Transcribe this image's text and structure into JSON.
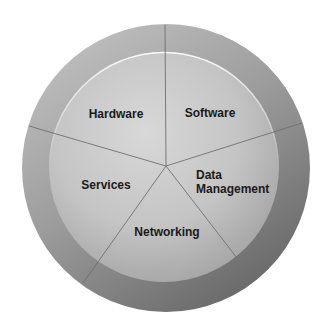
{
  "diagram": {
    "type": "segmented-circle",
    "segments": [
      {
        "id": "hardware",
        "label": "Hardware"
      },
      {
        "id": "software",
        "label": "Software"
      },
      {
        "id": "data-management",
        "label_line1": "Data",
        "label_line2": "Management"
      },
      {
        "id": "networking",
        "label": "Networking"
      },
      {
        "id": "services",
        "label": "Services"
      }
    ],
    "colors": {
      "background": "#ffffff",
      "outer_ring_light": "#b4b4b4",
      "outer_ring_dark": "#6e6e6e",
      "inner_fill_light": "#d6d6d6",
      "inner_fill_dark": "#a4a4a4",
      "divider": "#6f6f6f",
      "text": "#1a1a1a"
    }
  }
}
